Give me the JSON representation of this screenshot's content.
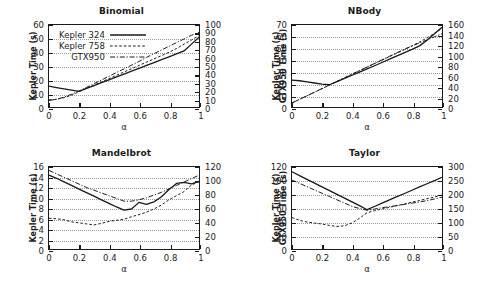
{
  "figure": {
    "xlabel": "α",
    "ylabel_left": "Kepler Time (s)",
    "ylabel_right": "GTX950 Time (s)",
    "xticks": [
      "0",
      "0.2",
      "0.4",
      "0.6",
      "0.8",
      "1"
    ],
    "legend": [
      {
        "label": "Kepler 324",
        "style": "solid"
      },
      {
        "label": "Kepler 758",
        "style": "dashed"
      },
      {
        "label": "GTX950",
        "style": "dashdot"
      }
    ],
    "colors": {
      "line": "#1a1a1a",
      "grid": "#9a9a9a",
      "background": "#ffffff"
    }
  },
  "chart_data": [
    {
      "type": "line",
      "title": "Binomial",
      "xlabel": "α",
      "ylabel": "Kepler Time (s)",
      "ylabel_right": "GTX950 Time (s)",
      "xlim": [
        0,
        1
      ],
      "ylim": [
        0,
        60
      ],
      "ylim_right": [
        0,
        100
      ],
      "yticks": [
        0,
        10,
        20,
        30,
        40,
        50,
        60
      ],
      "yticks_right": [
        0,
        10,
        20,
        30,
        40,
        50,
        60,
        70,
        80,
        90,
        100
      ],
      "xticks": [
        0,
        0.2,
        0.4,
        0.6,
        0.8,
        1
      ],
      "grid": true,
      "legend_position": "upper-left",
      "x": [
        0,
        0.05,
        0.1,
        0.15,
        0.2,
        0.25,
        0.3,
        0.35,
        0.4,
        0.45,
        0.5,
        0.55,
        0.6,
        0.65,
        0.7,
        0.75,
        0.8,
        0.85,
        0.9,
        0.95,
        1
      ],
      "series": [
        {
          "name": "Kepler 324",
          "axis": "left",
          "style": "solid",
          "values": [
            15.2,
            14.2,
            13.3,
            12.4,
            11.5,
            13.6,
            15.7,
            17.8,
            19.9,
            22.0,
            24.1,
            26.2,
            28.3,
            30.4,
            32.5,
            34.6,
            36.7,
            38.8,
            41.0,
            46.0,
            51.0
          ]
        },
        {
          "name": "Kepler 758",
          "axis": "left",
          "style": "dashed",
          "values": [
            5.2,
            5.6,
            6.8,
            8.6,
            11.2,
            13.6,
            16.0,
            18.4,
            20.8,
            23.2,
            25.6,
            28.0,
            30.4,
            32.8,
            35.2,
            37.6,
            40.0,
            42.8,
            46.0,
            49.0,
            52.2
          ]
        },
        {
          "name": "GTX950",
          "axis": "right",
          "style": "dashdot",
          "values": [
            8.0,
            9.5,
            12.0,
            15.5,
            19.5,
            24.0,
            28.5,
            33.0,
            37.5,
            42.0,
            46.5,
            51.0,
            55.5,
            60.5,
            65.0,
            69.5,
            74.0,
            78.5,
            83.0,
            87.5,
            91.0
          ]
        }
      ]
    },
    {
      "type": "line",
      "title": "NBody",
      "xlabel": "α",
      "ylabel": "Kepler Time (s)",
      "ylabel_right": "GTX950 Time (s)",
      "xlim": [
        0,
        1
      ],
      "ylim": [
        0,
        70
      ],
      "ylim_right": [
        0,
        160
      ],
      "yticks": [
        0,
        10,
        20,
        30,
        40,
        50,
        60,
        70
      ],
      "yticks_right": [
        0,
        20,
        40,
        60,
        80,
        100,
        120,
        140,
        160
      ],
      "xticks": [
        0,
        0.2,
        0.4,
        0.6,
        0.8,
        1
      ],
      "grid": true,
      "legend_position": "none",
      "x": [
        0,
        0.05,
        0.1,
        0.15,
        0.2,
        0.25,
        0.3,
        0.35,
        0.4,
        0.45,
        0.5,
        0.55,
        0.6,
        0.65,
        0.7,
        0.75,
        0.8,
        0.85,
        0.9,
        0.95,
        1
      ],
      "series": [
        {
          "name": "Kepler 324",
          "axis": "left",
          "style": "solid",
          "values": [
            23.0,
            22.4,
            21.5,
            20.5,
            19.5,
            19.0,
            21.7,
            24.4,
            27.1,
            29.8,
            32.5,
            35.2,
            38.0,
            40.8,
            43.6,
            46.4,
            49.2,
            52.2,
            57.0,
            62.5,
            68.0
          ]
        },
        {
          "name": "Kepler 758",
          "axis": "left",
          "style": "dashed",
          "values": [
            3.5,
            6.5,
            9.5,
            12.5,
            15.6,
            18.7,
            21.8,
            24.9,
            28.0,
            31.0,
            34.0,
            37.0,
            40.0,
            43.0,
            46.0,
            49.0,
            52.2,
            55.5,
            59.0,
            63.0,
            67.0
          ]
        },
        {
          "name": "GTX950",
          "axis": "right",
          "style": "dashdot",
          "values": [
            8.0,
            15.0,
            22.0,
            29.0,
            36.0,
            43.0,
            50.0,
            57.0,
            64.0,
            71.0,
            78.0,
            85.0,
            92.0,
            99.0,
            106.0,
            113.0,
            119.0,
            125.0,
            131.0,
            137.0,
            143.0
          ]
        }
      ]
    },
    {
      "type": "line",
      "title": "Mandelbrot",
      "xlabel": "α",
      "ylabel": "Kepler Time (s)",
      "ylabel_right": "GTX950 Time (s)",
      "xlim": [
        0,
        1
      ],
      "ylim": [
        0,
        16
      ],
      "ylim_right": [
        0,
        120
      ],
      "yticks": [
        0,
        2,
        4,
        6,
        8,
        10,
        12,
        14,
        16
      ],
      "yticks_right": [
        0,
        20,
        40,
        60,
        80,
        100,
        120
      ],
      "xticks": [
        0,
        0.2,
        0.4,
        0.6,
        0.8,
        1
      ],
      "grid": true,
      "legend_position": "none",
      "x": [
        0,
        0.05,
        0.1,
        0.15,
        0.2,
        0.25,
        0.3,
        0.35,
        0.4,
        0.45,
        0.5,
        0.55,
        0.6,
        0.65,
        0.7,
        0.75,
        0.8,
        0.85,
        0.9,
        0.95,
        1
      ],
      "series": [
        {
          "name": "Kepler 324",
          "axis": "left",
          "style": "solid",
          "values": [
            14.4,
            13.8,
            13.1,
            12.4,
            11.7,
            11.0,
            10.3,
            9.6,
            8.9,
            8.2,
            7.6,
            7.8,
            9.1,
            8.7,
            9.2,
            10.2,
            11.6,
            12.8,
            13.0,
            12.7,
            13.2
          ]
        },
        {
          "name": "Kepler 758",
          "axis": "left",
          "style": "dashed",
          "values": [
            6.0,
            5.9,
            5.7,
            5.3,
            5.1,
            4.9,
            4.7,
            5.0,
            5.4,
            5.6,
            5.8,
            6.3,
            6.7,
            7.2,
            7.8,
            8.6,
            9.6,
            10.4,
            11.2,
            12.5,
            13.1
          ]
        },
        {
          "name": "GTX950",
          "axis": "right",
          "style": "dashdot",
          "values": [
            115.0,
            110.0,
            105.0,
            100.0,
            95.0,
            90.0,
            86.0,
            82.0,
            78.0,
            74.0,
            70.0,
            70.0,
            72.0,
            75.0,
            79.0,
            83.0,
            88.0,
            93.0,
            98.0,
            103.0,
            108.0
          ]
        }
      ]
    },
    {
      "type": "line",
      "title": "Taylor",
      "xlabel": "α",
      "ylabel": "Kepler Time (s)",
      "ylabel_right": "GTX950 Time (s)",
      "xlim": [
        0,
        1
      ],
      "ylim": [
        0,
        120
      ],
      "ylim_right": [
        0,
        300
      ],
      "yticks": [
        0,
        20,
        40,
        60,
        80,
        100,
        120
      ],
      "yticks_right": [
        0,
        50,
        100,
        150,
        200,
        250,
        300
      ],
      "xticks": [
        0,
        0.2,
        0.4,
        0.6,
        0.8,
        1
      ],
      "grid": true,
      "legend_position": "none",
      "x": [
        0,
        0.05,
        0.1,
        0.15,
        0.2,
        0.25,
        0.3,
        0.35,
        0.4,
        0.45,
        0.5,
        0.55,
        0.6,
        0.65,
        0.7,
        0.75,
        0.8,
        0.85,
        0.9,
        0.95,
        1
      ],
      "series": [
        {
          "name": "Kepler 324",
          "axis": "left",
          "style": "solid",
          "values": [
            113.0,
            107.5,
            102.0,
            96.5,
            91.0,
            85.5,
            80.0,
            74.5,
            69.0,
            63.5,
            57.5,
            62.2,
            67.0,
            71.8,
            76.5,
            81.2,
            86.0,
            90.8,
            95.5,
            100.2,
            105.0
          ]
        },
        {
          "name": "Kepler 758",
          "axis": "left",
          "style": "dashed",
          "values": [
            46.0,
            42.0,
            39.5,
            38.0,
            36.5,
            34.5,
            33.0,
            34.0,
            38.0,
            45.0,
            53.0,
            56.0,
            58.5,
            61.0,
            63.5,
            66.0,
            68.5,
            71.0,
            73.5,
            76.0,
            79.0
          ]
        },
        {
          "name": "GTX950",
          "axis": "right",
          "style": "dashdot",
          "values": [
            252.0,
            240.0,
            228.0,
            216.0,
            204.0,
            192.0,
            180.0,
            168.0,
            156.0,
            148.0,
            142.0,
            146.0,
            151.0,
            155.0,
            159.0,
            163.0,
            168.0,
            172.0,
            177.0,
            183.0,
            190.0
          ]
        }
      ]
    }
  ]
}
